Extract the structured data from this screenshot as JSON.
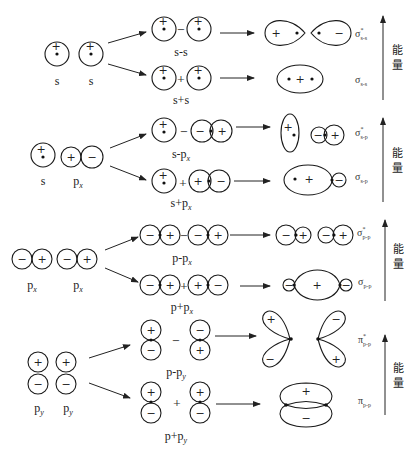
{
  "energy_axis_label": [
    "能",
    "量"
  ],
  "groups": [
    {
      "id": "s-s",
      "atomic_labels": [
        "s",
        "s"
      ],
      "antibonding_combo_label": "s-s",
      "bonding_combo_label": "s+s",
      "antibonding_mo": {
        "symbol": "σ",
        "star": "*",
        "subscript": "s-s"
      },
      "bonding_mo": {
        "symbol": "σ",
        "subscript": "s-s"
      }
    },
    {
      "id": "s-px",
      "atomic_labels": [
        "s",
        "p",
        "x"
      ],
      "antibonding_combo_label": "s-p",
      "bonding_combo_label": "s+p",
      "combo_sub": "x",
      "antibonding_mo": {
        "symbol": "σ",
        "star": "*",
        "subscript": "s-p"
      },
      "bonding_mo": {
        "symbol": "σ",
        "subscript": "s-p"
      }
    },
    {
      "id": "px-px",
      "atomic_labels": [
        "p",
        "x"
      ],
      "antibonding_combo_label": "p-p",
      "bonding_combo_label": "p+p",
      "combo_sub": "x",
      "antibonding_mo": {
        "symbol": "σ",
        "star": "*",
        "subscript": "p-p"
      },
      "bonding_mo": {
        "symbol": "σ",
        "subscript": "p-p"
      }
    },
    {
      "id": "py-py",
      "atomic_labels": [
        "p",
        "y"
      ],
      "antibonding_combo_label": "p-p",
      "bonding_combo_label": "p+p",
      "combo_sub": "y",
      "antibonding_mo": {
        "symbol": "π",
        "star": "*",
        "subscript": "p-p"
      },
      "bonding_mo": {
        "symbol": "π",
        "subscript": "p-p"
      }
    }
  ],
  "signs": {
    "plus": "+",
    "minus": "−"
  }
}
